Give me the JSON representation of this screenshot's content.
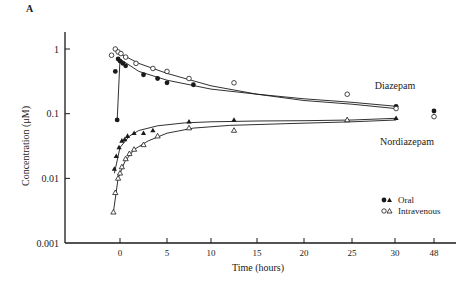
{
  "panel_label": "A",
  "chart_data": {
    "type": "scatter",
    "title": "",
    "panel": "A",
    "xlabel": "Time (hours)",
    "ylabel": "Concentration (μM)",
    "yscale": "log",
    "ylim": [
      0.001,
      1.5
    ],
    "xlim": [
      -6,
      35
    ],
    "x_ticks": [
      0,
      5,
      10,
      15,
      20,
      25,
      30,
      48
    ],
    "x_tick_labels": [
      "0",
      "5",
      "10",
      "15",
      "20",
      "25",
      "30",
      "48"
    ],
    "y_ticks": [
      1,
      0.1,
      0.01,
      0.001
    ],
    "y_tick_labels": [
      "1",
      "0.1",
      "0.01",
      "0.001"
    ],
    "grid": false,
    "legend": {
      "position": "lower right",
      "entries": [
        {
          "label": "Oral",
          "markers": [
            "filled-circle",
            "filled-triangle"
          ]
        },
        {
          "label": "Intravenous",
          "markers": [
            "open-circle",
            "open-triangle"
          ]
        }
      ]
    },
    "annotations": [
      {
        "text": "Diazepam",
        "x": 30,
        "y": 0.2
      },
      {
        "text": "Nordiazepam",
        "x": 28,
        "y": 0.025
      }
    ],
    "series": [
      {
        "name": "Diazepam - Oral",
        "marker": "filled-circle",
        "x": [
          -0.5,
          -0.3,
          -0.2,
          0,
          0.3,
          0.6,
          2.5,
          4,
          5,
          8,
          30.5,
          48
        ],
        "y": [
          0.45,
          0.08,
          0.7,
          0.65,
          0.6,
          0.55,
          0.4,
          0.35,
          0.3,
          0.28,
          0.13,
          0.11
        ]
      },
      {
        "name": "Diazepam - Intravenous",
        "marker": "open-circle",
        "x": [
          -0.9,
          -0.5,
          -0.2,
          0.1,
          0.6,
          1.7,
          3.5,
          5,
          7.5,
          12.5,
          24.5,
          30.5,
          48
        ],
        "y": [
          0.8,
          1.0,
          0.9,
          0.85,
          0.75,
          0.6,
          0.5,
          0.45,
          0.35,
          0.3,
          0.2,
          0.12,
          0.09
        ]
      },
      {
        "name": "Nordiazepam - Oral",
        "marker": "filled-triangle",
        "x": [
          -0.6,
          -0.4,
          -0.1,
          0.2,
          0.5,
          0.8,
          1.5,
          2.5,
          3.5,
          7.5,
          12.5,
          24.5,
          30.5
        ],
        "y": [
          0.014,
          0.022,
          0.03,
          0.038,
          0.04,
          0.045,
          0.05,
          0.05,
          0.055,
          0.075,
          0.08,
          0.08,
          0.085
        ]
      },
      {
        "name": "Nordiazepam - Intravenous",
        "marker": "open-triangle",
        "x": [
          -0.7,
          -0.5,
          -0.2,
          0,
          0.2,
          0.6,
          1,
          1.5,
          2.5,
          4,
          7.5,
          12.5,
          24.5
        ],
        "y": [
          0.003,
          0.006,
          0.01,
          0.012,
          0.015,
          0.02,
          0.024,
          0.028,
          0.033,
          0.045,
          0.06,
          0.055,
          0.08
        ]
      }
    ],
    "fit_curves": [
      {
        "name": "Diazepam - Oral fit",
        "x": [
          -0.3,
          0,
          2,
          5,
          10,
          15,
          20,
          25,
          30.5
        ],
        "y": [
          0.08,
          0.7,
          0.45,
          0.33,
          0.24,
          0.2,
          0.17,
          0.15,
          0.13
        ]
      },
      {
        "name": "Diazepam - Intravenous fit",
        "x": [
          -0.5,
          0,
          2,
          5,
          10,
          15,
          20,
          25,
          30.5
        ],
        "y": [
          1.0,
          0.85,
          0.6,
          0.42,
          0.27,
          0.2,
          0.16,
          0.14,
          0.12
        ]
      },
      {
        "name": "Nordiazepam - Oral fit",
        "x": [
          -0.6,
          0,
          1,
          2,
          4,
          7,
          10,
          15,
          20,
          25,
          30.5
        ],
        "y": [
          0.012,
          0.03,
          0.045,
          0.055,
          0.065,
          0.072,
          0.075,
          0.077,
          0.078,
          0.08,
          0.085
        ]
      },
      {
        "name": "Nordiazepam - Intravenous fit",
        "x": [
          -0.7,
          -0.2,
          0.5,
          1.5,
          3,
          5,
          8,
          12,
          18,
          25,
          30.5
        ],
        "y": [
          0.003,
          0.01,
          0.018,
          0.028,
          0.038,
          0.05,
          0.06,
          0.066,
          0.07,
          0.075,
          0.08
        ]
      }
    ]
  }
}
